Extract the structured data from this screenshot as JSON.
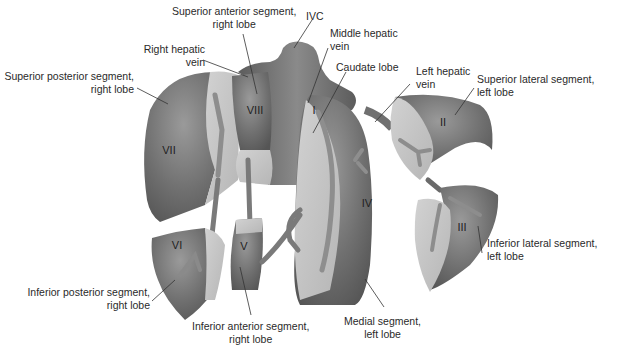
{
  "diagram": {
    "colors": {
      "dark_surface": "#6e6e6e",
      "mid_surface": "#8a8a8a",
      "cut_surface": "#c4c4c4",
      "vessel": "#7a7a7a",
      "leader_line": "#333333",
      "text": "#2a2a2a"
    },
    "segment_numerals": {
      "I": "I",
      "II": "II",
      "III": "III",
      "IV": "IV",
      "V": "V",
      "VI": "VI",
      "VII": "VII",
      "VIII": "VIII"
    },
    "labels": {
      "superior_anterior": {
        "line1": "Superior anterior segment,",
        "line2": "right lobe"
      },
      "ivc": {
        "line1": "IVC"
      },
      "middle_hepatic_vein": {
        "line1": "Middle hepatic",
        "line2": "vein"
      },
      "right_hepatic_vein": {
        "line1": "Right hepatic",
        "line2": "vein"
      },
      "superior_posterior": {
        "line1": "Superior posterior segment,",
        "line2": "right lobe"
      },
      "caudate_lobe": {
        "line1": "Caudate lobe"
      },
      "left_hepatic_vein": {
        "line1": "Left hepatic",
        "line2": "vein"
      },
      "superior_lateral": {
        "line1": "Superior lateral segment,",
        "line2": "left lobe"
      },
      "inferior_lateral": {
        "line1": "Inferior lateral segment,",
        "line2": "left lobe"
      },
      "inferior_posterior": {
        "line1": "Inferior posterior segment,",
        "line2": "right lobe"
      },
      "inferior_anterior": {
        "line1": "Inferior anterior segment,",
        "line2": "right lobe"
      },
      "medial_segment": {
        "line1": "Medial segment,",
        "line2": "left lobe"
      }
    }
  }
}
